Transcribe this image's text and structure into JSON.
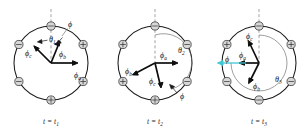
{
  "figure": {
    "background": "#ffffff",
    "ink": "#141414",
    "accent_cyan": "#3fc8d4",
    "slot_fill": "#d7d7d7"
  },
  "panels": [
    {
      "id": "panel-1",
      "caption": "t = t",
      "caption_sub": "1",
      "angle_label": "θ",
      "angle_sub": "1",
      "flux_label": "ϕ",
      "vectors": [
        {
          "name": "phi-a",
          "label": "ϕ",
          "sub": "a"
        },
        {
          "name": "phi-b",
          "label": "ϕ",
          "sub": "b"
        },
        {
          "name": "phi-c",
          "label": "ϕ",
          "sub": "c"
        }
      ],
      "slots": [
        {
          "position": "top",
          "polarity": "minus"
        },
        {
          "position": "upper-left",
          "polarity": "minus"
        },
        {
          "position": "upper-right",
          "polarity": "plus"
        },
        {
          "position": "lower-left",
          "polarity": "minus"
        },
        {
          "position": "lower-right",
          "polarity": "plus"
        },
        {
          "position": "bottom",
          "polarity": "plus"
        }
      ]
    },
    {
      "id": "panel-2",
      "caption": "t = t",
      "caption_sub": "2",
      "angle_label": "θ",
      "angle_sub": "2",
      "flux_label": "ϕ",
      "vectors": [
        {
          "name": "phi-a",
          "label": "ϕ",
          "sub": "a"
        },
        {
          "name": "phi-b",
          "label": "ϕ",
          "sub": "b"
        },
        {
          "name": "phi-c",
          "label": "ϕ",
          "sub": "c"
        }
      ],
      "slots": [
        {
          "position": "top",
          "polarity": "minus"
        },
        {
          "position": "upper-left",
          "polarity": "plus"
        },
        {
          "position": "upper-right",
          "polarity": "minus"
        },
        {
          "position": "lower-left",
          "polarity": "plus"
        },
        {
          "position": "lower-right",
          "polarity": "minus"
        },
        {
          "position": "bottom",
          "polarity": "plus"
        }
      ]
    },
    {
      "id": "panel-3",
      "caption": "t = t",
      "caption_sub": "3",
      "angle_label": "θ",
      "angle_sub": "3",
      "flux_label": "ϕ",
      "vectors": [
        {
          "name": "phi-a",
          "label": "ϕ",
          "sub": "a"
        },
        {
          "name": "phi-b",
          "label": "ϕ",
          "sub": "b"
        },
        {
          "name": "phi-c",
          "label": "ϕ",
          "sub": "c"
        }
      ],
      "slots": [
        {
          "position": "top",
          "polarity": "minus"
        },
        {
          "position": "upper-left",
          "polarity": "plus"
        },
        {
          "position": "upper-right",
          "polarity": "plus"
        },
        {
          "position": "lower-left",
          "polarity": "minus"
        },
        {
          "position": "lower-right",
          "polarity": "minus"
        },
        {
          "position": "bottom",
          "polarity": "minus"
        }
      ]
    }
  ]
}
